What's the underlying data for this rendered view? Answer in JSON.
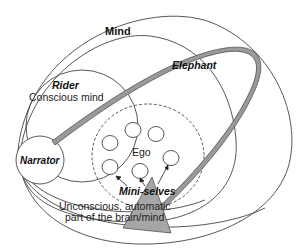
{
  "diagram": {
    "labels": {
      "mind": "Mind",
      "elephant": "Elephant",
      "rider": "Rider",
      "conscious_mind": "Conscious mind",
      "narrator": "Narrator",
      "ego": "Ego",
      "mini_selves": "Mini-selves",
      "unconscious_line1": "Unconscious, automatic",
      "unconscious_line2": "part of the brain/mind"
    },
    "colors": {
      "stroke": "#333333",
      "band_fill": "#9a9a9a",
      "band_edge": "#444444",
      "triangle_fill": "#a6a6a6",
      "background": "#ffffff"
    },
    "mini_self_count": 6
  }
}
